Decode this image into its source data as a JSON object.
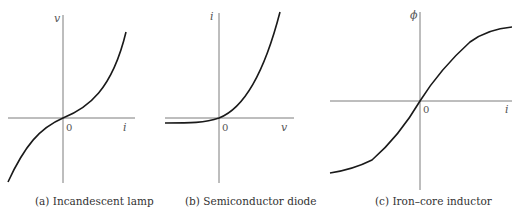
{
  "panels": [
    {
      "id": "a",
      "caption": "(a) Incandescent lamp",
      "x_axis_label": "i",
      "y_axis_label": "v",
      "origin_label": "0",
      "curve": "cubic-like odd function, v grows faster than linear with |i|"
    },
    {
      "id": "b",
      "caption": "(b) Semiconductor diode",
      "x_axis_label": "v",
      "y_axis_label": "i",
      "origin_label": "0",
      "curve": "exponential, small negative saturation current for v<0"
    },
    {
      "id": "c",
      "caption": "(c) Iron–core inductor",
      "x_axis_label": "i",
      "y_axis_label": "ϕ",
      "origin_label": "0",
      "curve": "sigmoid saturation, odd function"
    }
  ],
  "colors": {
    "curve": "#1a1a1a",
    "axis": "#6e6e6e",
    "text": "#333333"
  }
}
